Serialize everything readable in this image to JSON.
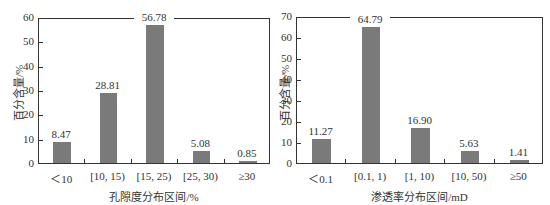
{
  "chart_data": [
    {
      "type": "bar",
      "title": "",
      "categories": [
        "<10",
        "[10, 15)",
        "[15, 25)",
        "[25, 30)",
        "≥30"
      ],
      "category_labels": [
        "＜10",
        "[10, 15)",
        "[15, 25)",
        "[25, 30)",
        "≥30"
      ],
      "values": [
        8.47,
        28.81,
        56.78,
        5.08,
        0.85
      ],
      "value_labels": [
        "8.47",
        "28.81",
        "56.78",
        "5.08",
        "0.85"
      ],
      "xlabel": "孔隙度分布区间/%",
      "ylabel": "百分含量/%",
      "ylim": [
        0,
        60
      ],
      "yticks": [
        0,
        10,
        20,
        30,
        40,
        50,
        60
      ],
      "grid": false,
      "legend": null,
      "bar_color": "#7a7a7a"
    },
    {
      "type": "bar",
      "title": "",
      "categories": [
        "<0.1",
        "[0.1, 1)",
        "[1, 10)",
        "[10, 50)",
        "≥50"
      ],
      "category_labels": [
        "＜0.1",
        "[0.1, 1)",
        "[1, 10)",
        "[10, 50)",
        "≥50"
      ],
      "values": [
        11.27,
        64.79,
        16.9,
        5.63,
        1.41
      ],
      "value_labels": [
        "11.27",
        "64.79",
        "16.90",
        "5.63",
        "1.41"
      ],
      "xlabel": "渗透率分布区间/mD",
      "ylabel": "百分含量/%",
      "ylim": [
        0,
        70
      ],
      "yticks": [
        0,
        10,
        20,
        30,
        40,
        50,
        60,
        70
      ],
      "grid": false,
      "legend": null,
      "bar_color": "#7a7a7a"
    }
  ]
}
